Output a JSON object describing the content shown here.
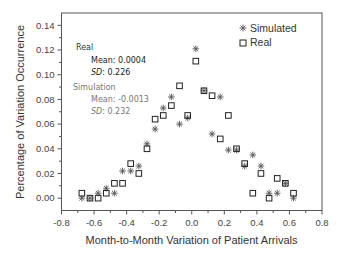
{
  "chart_data": {
    "type": "scatter",
    "title": "",
    "xlabel": "Month-to-Month Variation of Patient Arrivals",
    "ylabel": "Percentage of Variation Occurrence",
    "xlim": [
      -0.8,
      0.8
    ],
    "ylim": [
      -0.01,
      0.15
    ],
    "xticks": [
      "-0.8",
      "-0.6",
      "-0.4",
      "-0.2",
      "0.0",
      "0.2",
      "0.4",
      "0.6",
      "0.8"
    ],
    "yticks": [
      "0.00",
      "0.02",
      "0.04",
      "0.06",
      "0.08",
      "0.10",
      "0.12",
      "0.14"
    ],
    "grid": false,
    "legend": {
      "position": "upper right",
      "entries": [
        {
          "label": "Simulated",
          "marker": "asterisk"
        },
        {
          "label": "Real",
          "marker": "open-square"
        }
      ]
    },
    "annotations": {
      "real_title": "Real",
      "real_mean": "Mean: 0.0004",
      "real_sd_label": "SD",
      "real_sd_value": ": 0.226",
      "sim_title": "Simulation",
      "sim_mean": "Mean: -0.0013",
      "sim_sd_label": "SD",
      "sim_sd_value": ": 0.232"
    },
    "series": [
      {
        "name": "Simulated",
        "marker": "asterisk",
        "color": "#555555",
        "x": [
          -0.675,
          -0.625,
          -0.575,
          -0.525,
          -0.475,
          -0.425,
          -0.375,
          -0.325,
          -0.275,
          -0.225,
          -0.175,
          -0.125,
          -0.075,
          -0.025,
          0.025,
          0.075,
          0.125,
          0.175,
          0.225,
          0.275,
          0.325,
          0.375,
          0.425,
          0.475,
          0.525,
          0.575,
          0.625
        ],
        "y": [
          0.0,
          0.0,
          0.004,
          0.008,
          0.004,
          0.022,
          0.022,
          0.026,
          0.044,
          0.056,
          0.073,
          0.082,
          0.06,
          0.065,
          0.121,
          0.087,
          0.052,
          0.082,
          0.039,
          0.039,
          0.026,
          0.035,
          0.026,
          0.004,
          0.004,
          0.012,
          0.0
        ]
      },
      {
        "name": "Real",
        "marker": "open-square",
        "color": "#222222",
        "x": [
          -0.675,
          -0.625,
          -0.575,
          -0.525,
          -0.475,
          -0.425,
          -0.375,
          -0.325,
          -0.275,
          -0.225,
          -0.175,
          -0.125,
          -0.075,
          -0.025,
          0.025,
          0.075,
          0.125,
          0.175,
          0.225,
          0.275,
          0.325,
          0.375,
          0.425,
          0.475,
          0.525,
          0.575,
          0.625
        ],
        "y": [
          0.004,
          0.0,
          0.0,
          0.004,
          0.012,
          0.012,
          0.028,
          0.02,
          0.04,
          0.064,
          0.067,
          0.075,
          0.091,
          0.067,
          0.111,
          0.087,
          0.083,
          0.048,
          0.067,
          0.04,
          0.028,
          0.004,
          0.02,
          0.0,
          0.016,
          0.012,
          0.004
        ]
      }
    ]
  },
  "colors": {
    "axis": "#333333",
    "real_annotation": "#333333",
    "sim_annotation": "#777777"
  }
}
